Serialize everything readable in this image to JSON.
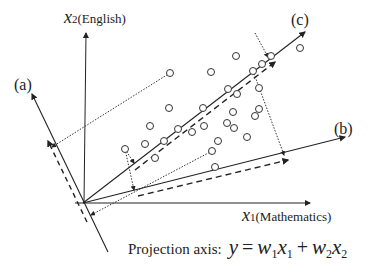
{
  "diagram": {
    "type": "projection-axes",
    "axes": {
      "x1": {
        "symbol": "x",
        "sub": "1",
        "name": "(Mathematics)"
      },
      "x2": {
        "symbol": "x",
        "sub": "2",
        "name": "(English)"
      }
    },
    "projection_axes": [
      {
        "label": "(a)"
      },
      {
        "label": "(b)"
      },
      {
        "label": "(c)"
      }
    ],
    "caption": {
      "prefix": "Projection axis:",
      "y": "y",
      "eq": "=",
      "w1": "w",
      "w1sub": "1",
      "x1": "x",
      "x1sub": "1",
      "plus": "+",
      "w2": "w",
      "w2sub": "2",
      "x2": "x",
      "x2sub": "2"
    },
    "points": [
      [
        170,
        73
      ],
      [
        211,
        72
      ],
      [
        236,
        56
      ],
      [
        271,
        56
      ],
      [
        259,
        88
      ],
      [
        253,
        71
      ],
      [
        228,
        89
      ],
      [
        169,
        108
      ],
      [
        203,
        108
      ],
      [
        150,
        126
      ],
      [
        204,
        126
      ],
      [
        178,
        129
      ],
      [
        192,
        132
      ],
      [
        227,
        123
      ],
      [
        233,
        112
      ],
      [
        145,
        144
      ],
      [
        164,
        141
      ],
      [
        218,
        141
      ],
      [
        247,
        137
      ],
      [
        212,
        151
      ],
      [
        125,
        149
      ],
      [
        155,
        158
      ],
      [
        215,
        167
      ],
      [
        234,
        128
      ],
      [
        255,
        116
      ],
      [
        237,
        94
      ],
      [
        262,
        64
      ],
      [
        300,
        48
      ],
      [
        259,
        109
      ]
    ],
    "colors": {
      "ink": "#222222",
      "background": "#ffffff"
    }
  }
}
